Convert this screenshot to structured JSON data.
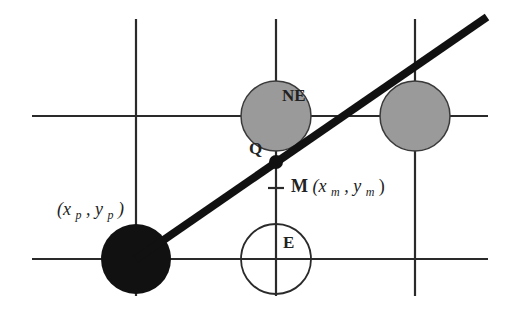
{
  "diagram": {
    "colors": {
      "grid": "#2a2a2a",
      "line": "#111111",
      "pixel_selected": "#111111",
      "pixel_candidate": "#9a9a9a",
      "pixel_empty": "#ffffff",
      "background": "#ffffff"
    },
    "labels": {
      "start_point": "(x",
      "start_sub_x": "p",
      "start_comma": ", y",
      "start_sub_y": "p",
      "start_close": ")",
      "ne": "NE",
      "e": "E",
      "q": "Q",
      "m": "M",
      "m_coords_open": " (x",
      "m_sub_x": "m",
      "m_comma": ", y",
      "m_sub_y": "m",
      "m_coords_close": ")"
    },
    "pixels": [
      {
        "name": "start-pixel",
        "cx": 136,
        "cy": 259,
        "state": "selected"
      },
      {
        "name": "e-pixel",
        "cx": 276,
        "cy": 259,
        "state": "empty"
      },
      {
        "name": "ne-pixel",
        "cx": 276,
        "cy": 116,
        "state": "candidate"
      },
      {
        "name": "next-pixel",
        "cx": 415,
        "cy": 116,
        "state": "candidate"
      }
    ]
  }
}
